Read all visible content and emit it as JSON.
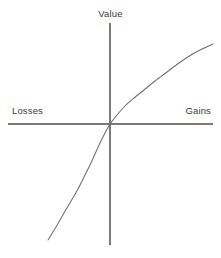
{
  "figure": {
    "title": "",
    "background_color": "#ffffff"
  },
  "labels": {
    "value": "Value",
    "losses": "Losses",
    "gains": "Gains"
  },
  "colors": {
    "axis": "#7a7a7a",
    "curve": "#6e6e6e",
    "text": "#3a3a3a",
    "background": "#ffffff"
  },
  "chart_data": {
    "type": "line",
    "title": "",
    "subtitle": "",
    "xlabel": "",
    "ylabel": "",
    "axis_labels": {
      "x_negative": "Losses",
      "x_positive": "Gains",
      "y_positive": "Value"
    },
    "grid": false,
    "legend": null,
    "xlim": [
      -1,
      1
    ],
    "ylim": [
      -1.35,
      0.78
    ],
    "origin_px": [
      110,
      124
    ],
    "axes": {
      "x_axis": {
        "y_px": 124,
        "x_start_px": 8,
        "x_end_px": 213
      },
      "y_axis": {
        "x_px": 110,
        "y_start_px": 23,
        "y_end_px": 245
      }
    },
    "series": [
      {
        "name": "Value function (gains)",
        "domain": "gains",
        "shape": "concave",
        "points_px": [
          [
            110,
            124
          ],
          [
            117,
            115
          ],
          [
            125,
            106
          ],
          [
            134,
            98
          ],
          [
            144,
            90
          ],
          [
            155,
            81
          ],
          [
            167,
            72
          ],
          [
            179,
            63
          ],
          [
            191,
            55
          ],
          [
            202,
            49
          ],
          [
            213,
            44
          ]
        ],
        "points_data": [
          [
            0.0,
            0.0
          ],
          [
            0.07,
            0.09
          ],
          [
            0.15,
            0.18
          ],
          [
            0.23,
            0.26
          ],
          [
            0.33,
            0.34
          ],
          [
            0.44,
            0.43
          ],
          [
            0.55,
            0.52
          ],
          [
            0.67,
            0.61
          ],
          [
            0.79,
            0.69
          ],
          [
            0.89,
            0.75
          ],
          [
            1.0,
            0.8
          ]
        ]
      },
      {
        "name": "Value function (losses)",
        "domain": "losses",
        "shape": "convex",
        "points_px": [
          [
            110,
            124
          ],
          [
            105,
            133
          ],
          [
            100,
            143
          ],
          [
            95,
            154
          ],
          [
            90,
            165
          ],
          [
            84,
            177
          ],
          [
            78,
            189
          ],
          [
            71,
            201
          ],
          [
            64,
            213
          ],
          [
            56,
            227
          ],
          [
            48,
            240
          ]
        ],
        "points_data": [
          [
            0.0,
            0.0
          ],
          [
            -0.05,
            -0.09
          ],
          [
            -0.1,
            -0.19
          ],
          [
            -0.15,
            -0.3
          ],
          [
            -0.2,
            -0.41
          ],
          [
            -0.26,
            -0.53
          ],
          [
            -0.31,
            -0.65
          ],
          [
            -0.38,
            -0.77
          ],
          [
            -0.45,
            -0.89
          ],
          [
            -0.53,
            -1.03
          ],
          [
            -0.61,
            -1.16
          ]
        ]
      }
    ]
  }
}
